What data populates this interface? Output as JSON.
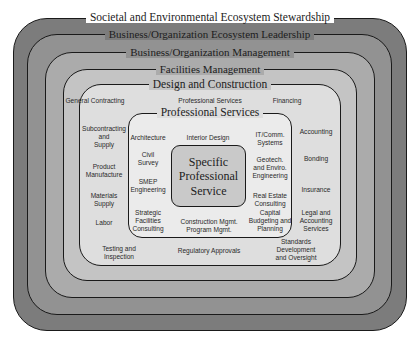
{
  "diagram": {
    "type": "nested-rounded-boxes",
    "layers": [
      {
        "id": "societal",
        "title": "Societal and Environmental Ecosystem Stewardship",
        "fill": "#7c7c7c"
      },
      {
        "id": "business-leadership",
        "title": "Business/Organization Ecosystem Leadership",
        "fill": "#929292"
      },
      {
        "id": "business-management",
        "title": "Business/Organization Management",
        "fill": "#ababab"
      },
      {
        "id": "facilities",
        "title": "Facilities Management",
        "fill": "#c4c4c4"
      },
      {
        "id": "design-construction",
        "title": "Design and Construction",
        "fill": "#dedede"
      },
      {
        "id": "professional-services",
        "title": "Professional Services",
        "fill": "#ebebeb"
      },
      {
        "id": "specific",
        "title": "Specific\nProfessional\nService",
        "fill": "#c9c9c9"
      }
    ],
    "design_construction_items": [
      {
        "text": "General Contracting",
        "x": 95,
        "y": 97
      },
      {
        "text": "Professional Services",
        "x": 210,
        "y": 97
      },
      {
        "text": "Financing",
        "x": 287,
        "y": 97
      },
      {
        "text": "Subcontracting\nand\nSupply",
        "x": 104,
        "y": 125
      },
      {
        "text": "Product\nManufacture",
        "x": 104,
        "y": 163
      },
      {
        "text": "Materials\nSupply",
        "x": 104,
        "y": 192
      },
      {
        "text": "Labor",
        "x": 104,
        "y": 219
      },
      {
        "text": "Accounting",
        "x": 316,
        "y": 128
      },
      {
        "text": "Bonding",
        "x": 316,
        "y": 155
      },
      {
        "text": "Insurance",
        "x": 316,
        "y": 186
      },
      {
        "text": "Legal and\nAccounting\nServices",
        "x": 316,
        "y": 209
      },
      {
        "text": "Testing and\nInspection",
        "x": 119,
        "y": 247
      },
      {
        "text": "Regulatory Approvals",
        "x": 209,
        "y": 247
      },
      {
        "text": "Standards\nDevelopment\nand Oversight",
        "x": 296,
        "y": 238
      }
    ],
    "professional_services_items": [
      {
        "text": "Architecture",
        "x": 148,
        "y": 134
      },
      {
        "text": "Interior Design",
        "x": 208,
        "y": 134
      },
      {
        "text": "IT/Comm.\nSystems",
        "x": 270,
        "y": 131
      },
      {
        "text": "Civil\nSurvey",
        "x": 148,
        "y": 151
      },
      {
        "text": "Geotech.\nand Enviro.\nEngineering",
        "x": 270,
        "y": 156
      },
      {
        "text": "SMEP\nEngineering",
        "x": 148,
        "y": 178
      },
      {
        "text": "Real Estate\nConsulting",
        "x": 270,
        "y": 192
      },
      {
        "text": "Strategic\nFacilities\nConsulting",
        "x": 148,
        "y": 210
      },
      {
        "text": "Construction Mgmt.\nProgram Mgmt.",
        "x": 209,
        "y": 218
      },
      {
        "text": "Capital\nBudgeting and\nPlanning",
        "x": 270,
        "y": 210
      }
    ]
  }
}
